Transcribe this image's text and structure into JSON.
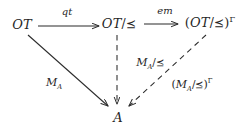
{
  "diagram": {
    "kind": "commutative-diagram",
    "background_color": "#ffffff",
    "ink_color": "#262626",
    "nodes": [
      {
        "id": "ot",
        "label": "OT",
        "base": "OT",
        "quotient": "",
        "superscript": ""
      },
      {
        "id": "ot_quot",
        "label": "OT/⪯",
        "base": "OT",
        "quotient": "⪯",
        "superscript": ""
      },
      {
        "id": "ot_quot_g",
        "label": "(OT/⪯)Γ",
        "base": "OT",
        "quotient": "⪯",
        "superscript": "Γ"
      },
      {
        "id": "a",
        "label": "A",
        "base": "A",
        "quotient": "",
        "superscript": ""
      }
    ],
    "node_text": {
      "ot": "OT",
      "ot_quot_base": "OT",
      "ot_quot_rel": "/⪯",
      "ot_quot_g_open": "(",
      "ot_quot_g_base": "OT",
      "ot_quot_g_rel": "/⪯",
      "ot_quot_g_close": ")",
      "ot_quot_g_sup": "Γ",
      "a": "A"
    },
    "edges": [
      {
        "id": "qt",
        "from": "ot",
        "to": "ot_quot",
        "label": "qt",
        "style": "solid",
        "arrowhead": "open"
      },
      {
        "id": "em",
        "from": "ot_quot",
        "to": "ot_quot_g",
        "label": "em",
        "style": "solid",
        "arrowhead": "open"
      },
      {
        "id": "ma",
        "from": "ot",
        "to": "a",
        "label": "MA",
        "style": "solid",
        "arrowhead": "open"
      },
      {
        "id": "ma_quot",
        "from": "ot_quot",
        "to": "a",
        "label": "MA/⪯",
        "style": "dashed",
        "arrowhead": "open"
      },
      {
        "id": "ma_quot_g",
        "from": "ot_quot_g",
        "to": "a",
        "label": "(MA/⪯)Γ",
        "style": "dashed",
        "arrowhead": "open"
      }
    ],
    "edge_text": {
      "qt": "qt",
      "em": "em",
      "ma_base": "M",
      "ma_sub": "A",
      "ma_quot_base": "M",
      "ma_quot_sub": "A",
      "ma_quot_rel": "/⪯",
      "ma_quot_g_open": "(",
      "ma_quot_g_base": "M",
      "ma_quot_g_sub": "A",
      "ma_quot_g_rel": "/⪯",
      "ma_quot_g_close": ")",
      "ma_quot_g_sup": "Γ"
    }
  }
}
